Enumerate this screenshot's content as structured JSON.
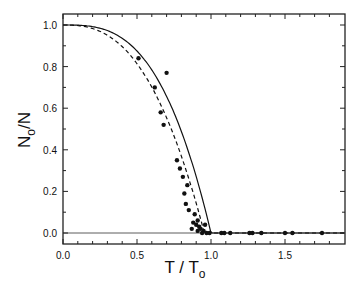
{
  "chart_data": {
    "type": "scatter",
    "title": "",
    "xlabel": "T / T_o",
    "ylabel": "N_o/N",
    "xlim": [
      0.0,
      1.9
    ],
    "ylim": [
      -0.05,
      1.05
    ],
    "grid": false,
    "legend": null,
    "x_ticks": [
      "0.0",
      "0.5",
      "1.0",
      "1.5"
    ],
    "y_ticks": [
      "0.0",
      "0.2",
      "0.4",
      "0.6",
      "0.8",
      "1.0"
    ],
    "series": [
      {
        "name": "data",
        "style": "filled-circle",
        "points": [
          [
            0.51,
            0.84
          ],
          [
            0.7,
            0.77
          ],
          [
            0.62,
            0.7
          ],
          [
            0.66,
            0.58
          ],
          [
            0.68,
            0.52
          ],
          [
            0.77,
            0.35
          ],
          [
            0.79,
            0.31
          ],
          [
            0.81,
            0.27
          ],
          [
            0.84,
            0.23
          ],
          [
            0.82,
            0.19
          ],
          [
            0.83,
            0.14
          ],
          [
            0.85,
            0.11
          ],
          [
            0.89,
            0.09
          ],
          [
            0.91,
            0.06
          ],
          [
            0.88,
            0.05
          ],
          [
            0.9,
            0.04
          ],
          [
            0.92,
            0.03
          ],
          [
            0.87,
            0.02
          ],
          [
            0.93,
            0.02
          ],
          [
            0.95,
            0.01
          ],
          [
            0.91,
            0.01
          ],
          [
            0.97,
            0.0
          ],
          [
            0.99,
            0.0
          ],
          [
            0.94,
            0.0
          ],
          [
            0.96,
            0.04
          ],
          [
            1.07,
            0.0
          ],
          [
            1.09,
            0.0
          ],
          [
            1.13,
            0.0
          ],
          [
            1.26,
            0.0
          ],
          [
            1.28,
            0.0
          ],
          [
            1.34,
            0.0
          ],
          [
            1.5,
            0.0
          ],
          [
            1.55,
            0.0
          ],
          [
            1.75,
            0.0
          ]
        ]
      },
      {
        "name": "solid curve",
        "style": "solid-line",
        "formula": "1 - (T/To)^3 for T<To, else 0"
      },
      {
        "name": "dashed curve",
        "style": "dashed-line",
        "formula": "1 - (T/To)^2.4 scaled, reaching 0 near T/To≈0.95"
      }
    ]
  },
  "axes": {
    "x_title_main": "T / T",
    "x_title_sub": "o",
    "y_title_main_1": "N",
    "y_title_sub": "o",
    "y_title_main_2": "/N"
  }
}
